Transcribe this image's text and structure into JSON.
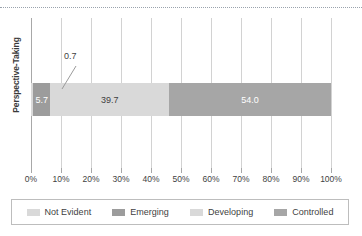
{
  "chart_data": {
    "type": "bar",
    "orientation": "horizontal",
    "stacked": true,
    "title": "",
    "xlabel": "",
    "ylabel": "Perspective-Taking",
    "categories": [
      "Perspective-Taking"
    ],
    "series": [
      {
        "name": "Not Evident",
        "values": [
          0.7
        ],
        "color": "#d9d9d9",
        "label": "0.7",
        "label_style": "callout"
      },
      {
        "name": "Emerging",
        "values": [
          5.7
        ],
        "color": "#9c9c9c",
        "label": "5.7",
        "label_style": "inside-white"
      },
      {
        "name": "Developing",
        "values": [
          39.7
        ],
        "color": "#d9d9d9",
        "label": "39.7",
        "label_style": "inside-dark"
      },
      {
        "name": "Controlled",
        "values": [
          54.0
        ],
        "color": "#a6a6a6",
        "label": "54.0",
        "label_style": "inside-white"
      }
    ],
    "xlim": [
      0,
      100
    ],
    "xticks": [
      0,
      10,
      20,
      30,
      40,
      50,
      60,
      70,
      80,
      90,
      100
    ],
    "xticklabels": [
      "0%",
      "10%",
      "20%",
      "30%",
      "40%",
      "50%",
      "60%",
      "70%",
      "80%",
      "90%",
      "100%"
    ],
    "grid": true,
    "grid_axis": "x",
    "legend_position": "bottom",
    "legend_entries": [
      "Not Evident",
      "Emerging",
      "Developing",
      "Controlled"
    ]
  },
  "axis": {
    "y_title": "Perspective-Taking",
    "x_tick_labels": [
      "0%",
      "10%",
      "20%",
      "30%",
      "40%",
      "50%",
      "60%",
      "70%",
      "80%",
      "90%",
      "100%"
    ]
  },
  "bar": {
    "segments": [
      {
        "name": "Not Evident",
        "value": 0.7,
        "label": "0.7"
      },
      {
        "name": "Emerging",
        "value": 5.7,
        "label": "5.7"
      },
      {
        "name": "Developing",
        "value": 39.7,
        "label": "39.7"
      },
      {
        "name": "Controlled",
        "value": 54.0,
        "label": "54.0"
      }
    ]
  },
  "legend": {
    "items": [
      {
        "label": "Not Evident",
        "color": "#d9d9d9"
      },
      {
        "label": "Emerging",
        "color": "#9c9c9c"
      },
      {
        "label": "Developing",
        "color": "#d9d9d9"
      },
      {
        "label": "Controlled",
        "color": "#a6a6a6"
      }
    ]
  },
  "colors": {
    "not_evident": "#d9d9d9",
    "emerging": "#9c9c9c",
    "developing": "#d9d9d9",
    "controlled": "#a6a6a6",
    "gridline": "#d2d2d2",
    "axis": "#a8a8a8",
    "text": "#3f3f3f",
    "label_light": "#ffffff"
  }
}
